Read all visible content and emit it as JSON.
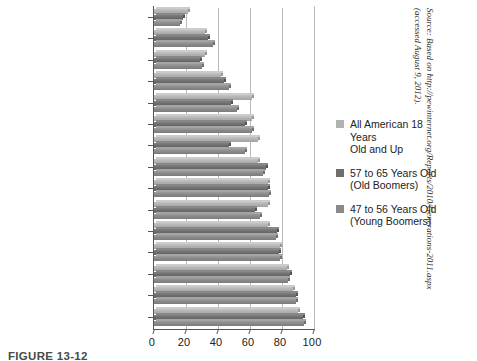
{
  "figure": {
    "caption": "FIGURE 13-12",
    "source_line1": "Source: Based on http://pewinternet.org/Reports/2010/Generations-2011.aspx",
    "source_line2": "(accessed August 9, 2012)."
  },
  "legend": {
    "items": [
      {
        "name": "all-american-18-and-up",
        "line1": "All American 18 Years",
        "line2": "Old and Up",
        "color": "#b2b2b2"
      },
      {
        "name": "old-boomers-57-65",
        "line1": "57 to 65 Years Old",
        "line2": "(Old Boomers)",
        "color": "#6e6e6e"
      },
      {
        "name": "young-boomers-47-56",
        "line1": "47 to 56 Years Old",
        "line2": "(Young Boomers)",
        "color": "#8a8a8a"
      }
    ]
  },
  "chart_data": {
    "type": "bar",
    "orientation": "horizontal",
    "title": "",
    "xlabel": "",
    "ylabel": "",
    "xlim": [
      0,
      100
    ],
    "xticks": [
      0,
      20,
      40,
      60,
      80,
      100
    ],
    "grid": true,
    "legend_position": "right",
    "categories": [
      "Download podcasts",
      "Rate products or services",
      "Read blogs",
      "Get financial information",
      "Listen to music",
      "Bank",
      "Use social networks",
      "Make travel arrangements",
      "Make purchases",
      "Watch videos",
      "Visit government websites",
      "Get news",
      "Look for health information",
      "Use search engines",
      "Send or read email"
    ],
    "series": [
      {
        "name": "All American 18 Years Old and Up",
        "color": "#b2b2b2",
        "values": [
          21,
          32,
          32,
          42,
          61,
          61,
          65,
          65,
          71,
          71,
          71,
          79,
          83,
          87,
          90
        ]
      },
      {
        "name": "57 to 65 Years Old (Old Boomers)",
        "color": "#6e6e6e",
        "values": [
          18,
          34,
          29,
          44,
          48,
          57,
          47,
          70,
          71,
          63,
          77,
          78,
          85,
          89,
          93
        ]
      },
      {
        "name": "47 to 56 Years Old (Young Boomers)",
        "color": "#8a8a8a",
        "values": [
          16,
          37,
          30,
          47,
          52,
          61,
          57,
          68,
          72,
          66,
          76,
          79,
          84,
          89,
          94
        ]
      }
    ]
  }
}
